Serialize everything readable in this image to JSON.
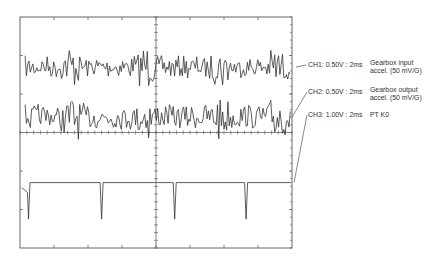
{
  "chart_data": {
    "type": "line",
    "title": "",
    "xlabel": "",
    "ylabel": "",
    "grid": "oscilloscope graticule, 8 vertical x 6 horizontal divisions with center crosshair",
    "time_base": "2ms/div",
    "xlim_div": [
      0,
      8
    ],
    "ylim_div": [
      -3,
      3
    ],
    "series": [
      {
        "name": "CH1",
        "label": "CH1: 0.50V : 2ms",
        "description": [
          "Gearbox input",
          "accel. (50 mV/G)"
        ],
        "volts_per_div": 0.5,
        "center_div": 1.7,
        "signal": "noise",
        "amplitude_div": 0.3,
        "bursts_at_div": [
          1.5,
          3.7,
          5.9,
          7.6
        ]
      },
      {
        "name": "CH2",
        "label": "CH2: 0.50V : 2ms",
        "description": [
          "Gearbox output",
          "accel. (50 mV/G)"
        ],
        "volts_per_div": 0.5,
        "center_div": 0.4,
        "signal": "noise",
        "amplitude_div": 0.35,
        "bursts_at_div": [
          1.55,
          3.75,
          5.9,
          7.6
        ]
      },
      {
        "name": "CH3",
        "label": "CH3: 1.00V : 2ms",
        "description": [
          "PT K0"
        ],
        "volts_per_div": 1.0,
        "baseline_div": -1.3,
        "signal": "pulse train",
        "pulse_depth_div": -0.95,
        "pulses_at_div": [
          0.25,
          2.4,
          4.55,
          6.65
        ]
      }
    ]
  }
}
